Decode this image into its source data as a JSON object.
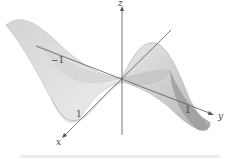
{
  "figure": {
    "axes": {
      "x_label": "x",
      "y_label": "y",
      "z_label": "z"
    },
    "ticks": {
      "x_tick": "1",
      "y_tick": "1",
      "neg_tick": "−1"
    },
    "colors": {
      "surface_light": "#e6e6e6",
      "surface_mid": "#cfcfcf",
      "surface_dark": "#9a9a9a",
      "axis": "#555555",
      "background": "#ffffff"
    }
  }
}
